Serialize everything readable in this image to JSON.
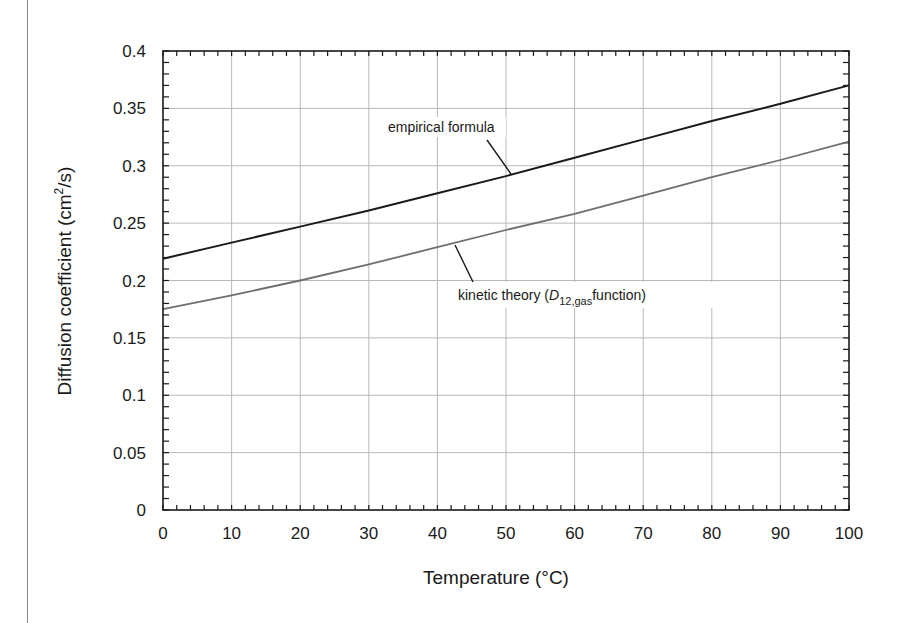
{
  "chart_data": {
    "type": "line",
    "title": "",
    "xlabel": "Temperature (°C)",
    "ylabel": "Diffusion coefficient (cm²/s)",
    "ylabel_parts": {
      "main": "Diffusion coefficient (cm",
      "sup": "2",
      "tail": "/s)"
    },
    "xlim": [
      0,
      100
    ],
    "ylim": [
      0,
      0.4
    ],
    "x_ticks": [
      0,
      10,
      20,
      30,
      40,
      50,
      60,
      70,
      80,
      90,
      100
    ],
    "x_tick_labels": [
      "0",
      "10",
      "20",
      "30",
      "40",
      "50",
      "60",
      "70",
      "80",
      "90",
      "100"
    ],
    "y_ticks": [
      0,
      0.05,
      0.1,
      0.15,
      0.2,
      0.25,
      0.3,
      0.35,
      0.4
    ],
    "y_tick_labels": [
      "0",
      "0.05",
      "0.1",
      "0.15",
      "0.2",
      "0.25",
      "0.3",
      "0.35",
      "0.4"
    ],
    "grid": true,
    "legend": "none (inline annotations)",
    "x": [
      0,
      10,
      20,
      30,
      40,
      50,
      60,
      70,
      80,
      90,
      100
    ],
    "series": [
      {
        "name": "empirical formula",
        "color": "#1a1a1a",
        "values": [
          0.219,
          0.233,
          0.247,
          0.261,
          0.276,
          0.291,
          0.307,
          0.323,
          0.339,
          0.354,
          0.37
        ]
      },
      {
        "name": "kinetic theory (D12,gas function)",
        "color": "#6e6e6e",
        "values": [
          0.175,
          0.187,
          0.2,
          0.214,
          0.229,
          0.244,
          0.258,
          0.274,
          0.29,
          0.305,
          0.321
        ]
      }
    ],
    "annotations": [
      {
        "text": "empirical formula",
        "series": 0,
        "points_to_x": 50
      },
      {
        "text_parts": {
          "pre": "kinetic theory (",
          "italic": "D",
          "sub": "12,gas",
          "post": "function)"
        },
        "series": 1,
        "points_to_x": 42
      }
    ]
  }
}
